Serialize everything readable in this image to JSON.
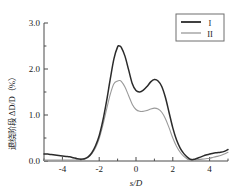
{
  "figure": {
    "background": "#ffffff",
    "axis_color": "#4a4a4a"
  },
  "chart_data": {
    "type": "line",
    "title": "",
    "subtitle": "",
    "xlabel": "s/D",
    "ylabel": "退绕阶段 ΔD/D（%）",
    "xlim": [
      -5,
      5
    ],
    "ylim": [
      0.0,
      3.0
    ],
    "grid": false,
    "legend_position": "top-right",
    "xticks": [
      -4,
      -2,
      0,
      2,
      4
    ],
    "xticklabels": [
      "-4",
      "-2",
      "0",
      "2",
      "4"
    ],
    "xminorticks": [
      -5,
      -3,
      -1,
      1,
      3,
      5
    ],
    "yticks": [
      0.0,
      1.0,
      2.0,
      3.0
    ],
    "yticklabels": [
      "0.0",
      "1.0",
      "2.0",
      "3.0"
    ],
    "yminorticks": [
      0.5,
      1.5,
      2.5
    ],
    "x": [
      -5.0,
      -4.8,
      -4.6,
      -4.4,
      -4.2,
      -4.0,
      -3.8,
      -3.6,
      -3.4,
      -3.2,
      -3.0,
      -2.8,
      -2.6,
      -2.4,
      -2.2,
      -2.0,
      -1.8,
      -1.6,
      -1.4,
      -1.2,
      -1.0,
      -0.9,
      -0.8,
      -0.6,
      -0.4,
      -0.2,
      0.0,
      0.2,
      0.4,
      0.6,
      0.8,
      1.0,
      1.2,
      1.4,
      1.6,
      1.8,
      2.0,
      2.2,
      2.4,
      2.6,
      2.8,
      3.0,
      3.2,
      3.4,
      3.6,
      3.8,
      4.0,
      4.2,
      4.4,
      4.6,
      4.8,
      5.0
    ],
    "series": [
      {
        "name": "I",
        "color": "#2b2b2b",
        "linewidth": 1.5,
        "values": [
          0.15,
          0.15,
          0.14,
          0.13,
          0.12,
          0.11,
          0.1,
          0.09,
          0.07,
          0.05,
          0.04,
          0.05,
          0.09,
          0.18,
          0.33,
          0.55,
          0.88,
          1.3,
          1.78,
          2.22,
          2.48,
          2.5,
          2.47,
          2.28,
          1.98,
          1.68,
          1.53,
          1.5,
          1.54,
          1.62,
          1.72,
          1.77,
          1.74,
          1.62,
          1.38,
          1.05,
          0.72,
          0.46,
          0.28,
          0.16,
          0.08,
          0.03,
          0.04,
          0.07,
          0.1,
          0.13,
          0.15,
          0.17,
          0.18,
          0.19,
          0.21,
          0.25
        ]
      },
      {
        "name": "II",
        "color": "#9a9a9a",
        "linewidth": 1.1,
        "values": [
          0.02,
          0.02,
          0.02,
          0.02,
          0.02,
          0.02,
          0.02,
          0.02,
          0.02,
          0.02,
          0.02,
          0.04,
          0.08,
          0.16,
          0.29,
          0.49,
          0.78,
          1.12,
          1.45,
          1.68,
          1.74,
          1.75,
          1.73,
          1.61,
          1.42,
          1.23,
          1.12,
          1.08,
          1.08,
          1.1,
          1.13,
          1.15,
          1.13,
          1.06,
          0.92,
          0.72,
          0.5,
          0.32,
          0.19,
          0.1,
          0.04,
          0.01,
          0.02,
          0.03,
          0.04,
          0.05,
          0.06,
          0.08,
          0.1,
          0.12,
          0.15,
          0.19
        ]
      }
    ]
  },
  "legend": {
    "entries": [
      {
        "label": "I",
        "color": "#2b2b2b"
      },
      {
        "label": "II",
        "color": "#9a9a9a"
      }
    ]
  }
}
